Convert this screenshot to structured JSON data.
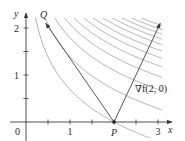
{
  "figure": {
    "function": "f(x, y) = x e^y",
    "level_curve_values": [
      2,
      4,
      6,
      8,
      10,
      12,
      14,
      16,
      18,
      20,
      22,
      24
    ],
    "colors": {
      "axes": "#3a3a3a",
      "curves": "#9a9a9a",
      "vectors": "#555555",
      "text": "#2a2a2a"
    },
    "axes": {
      "x_label": "x",
      "y_label": "y",
      "x_ticks": [
        0.5,
        1,
        1.5,
        2,
        2.5,
        3
      ],
      "y_ticks": [
        0.5,
        1,
        1.5,
        2
      ],
      "x_tick_labels": [
        {
          "value": 1,
          "text": "1"
        },
        {
          "value": 3,
          "text": "3"
        }
      ],
      "y_tick_labels": [
        {
          "value": 1,
          "text": "1"
        },
        {
          "value": 2,
          "text": "2"
        }
      ],
      "origin_label": "0"
    },
    "points": {
      "P": {
        "label": "P",
        "x": 2,
        "y": 0
      },
      "Q": {
        "label": "Q",
        "x": 0.45,
        "y": 2.1
      }
    },
    "vectors": [
      {
        "name": "PQ",
        "from": [
          2,
          0
        ],
        "to": [
          0.45,
          2.1
        ]
      },
      {
        "name": "gradient",
        "label": "∇f(2, 0)",
        "from": [
          2,
          0
        ],
        "to": [
          3.05,
          2.1
        ]
      }
    ]
  }
}
